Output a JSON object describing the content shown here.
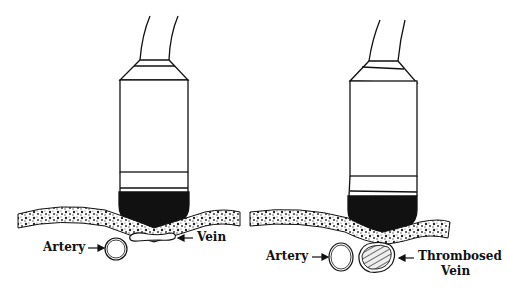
{
  "left_panel": {
    "artery_label": "Artery",
    "vein_label": "Vein"
  },
  "right_panel": {
    "artery_label": "Artery",
    "vein_label_line1": "Thrombosed",
    "vein_label_line2": "Vein"
  },
  "colors": {
    "ink": "#111111",
    "background": "#ffffff"
  }
}
